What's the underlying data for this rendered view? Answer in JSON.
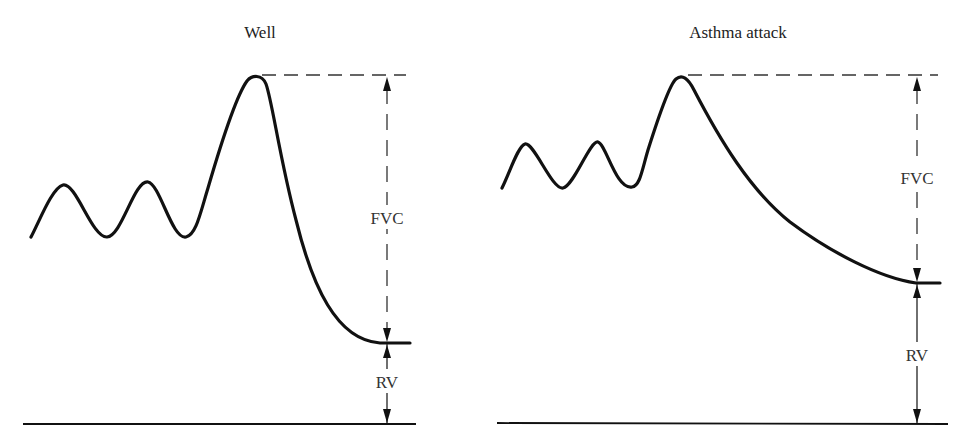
{
  "panels": [
    {
      "title": "Well",
      "labels": {
        "fvc": "FVC",
        "rv": "RV"
      }
    },
    {
      "title": "Asthma attack",
      "labels": {
        "fvc": "FVC",
        "rv": "RV"
      }
    }
  ],
  "colors": {
    "line": "#111111",
    "background": "#ffffff"
  }
}
